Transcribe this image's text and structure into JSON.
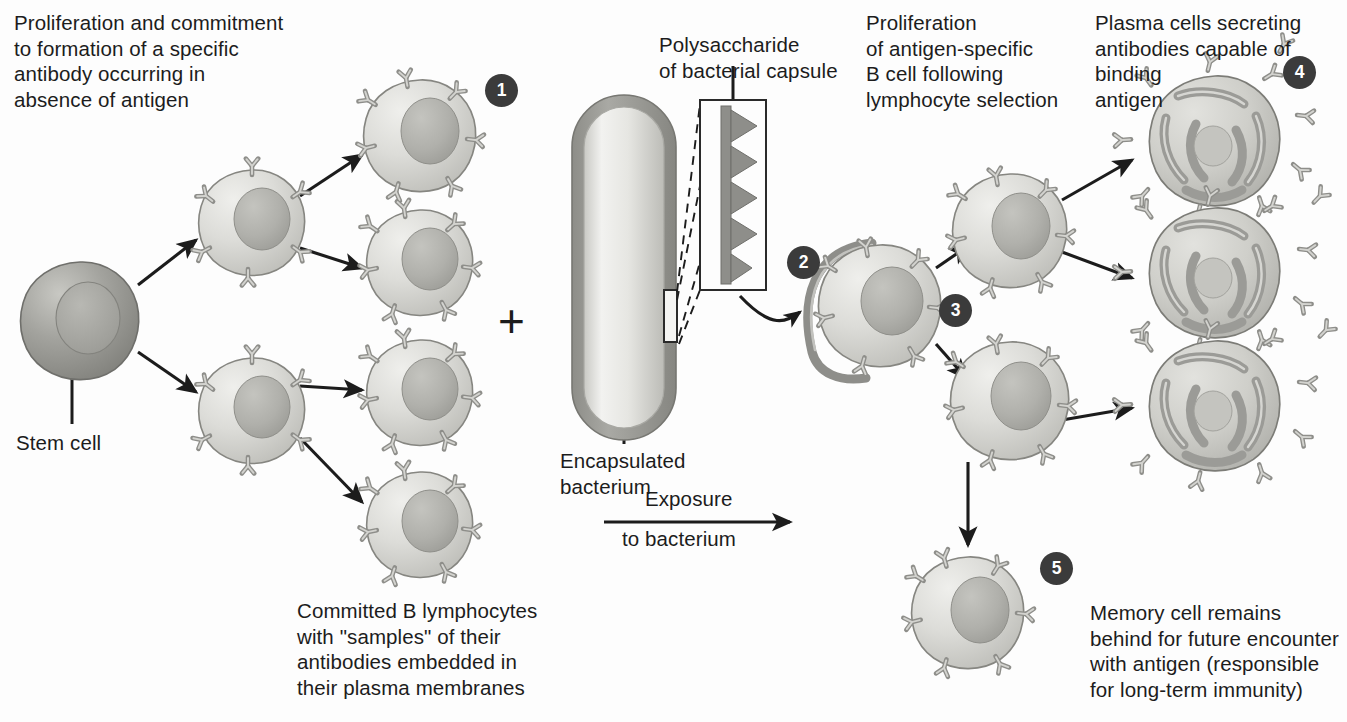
{
  "figure": {
    "background_color": "#fdfdfd",
    "ink_color": "#1c1c1c",
    "badge_color": "#3b3b3b",
    "badge_text_color": "#ffffff",
    "cell_fill": "#d9d9d6",
    "cell_outline": "#8b8b88",
    "nucleus_fill": "#b0b0ab",
    "stem_cell_fill": "#9a9a96",
    "plasma_cell_fill": "#c9c9c5",
    "er_fill": "#9b9b97",
    "antibody_fill": "#c6c6c2",
    "capsule_color": "#9a9a96",
    "antigen_color": "#8e8e8a"
  },
  "labels": {
    "intro": "Proliferation and commitment\nto formation of a specific\nantibody occurring in\nabsence of antigen",
    "stem_cell": "Stem cell",
    "committed_b": "Committed B lymphocytes\nwith \"samples\" of their\nantibodies embedded in\ntheir plasma membranes",
    "polysaccharide": "Polysaccharide\nof bacterial capsule",
    "encapsulated": "Encapsulated\nbacterium",
    "exposure_top": "Exposure",
    "exposure_bottom": "to bacterium",
    "proliferation": "Proliferation\nof antigen-specific\nB cell following\nlymphocyte selection",
    "plasma_cells": "Plasma cells secreting\nantibodies capable of\nbinding\nantigen",
    "memory_cell": "Memory cell remains\nbehind for future encounter\nwith antigen (responsible\nfor long-term immunity)",
    "plus_symbol": "+"
  },
  "badges": [
    {
      "id": "badge-1",
      "number": "1",
      "x": 485,
      "y": 74
    },
    {
      "id": "badge-2",
      "number": "2",
      "x": 787,
      "y": 246
    },
    {
      "id": "badge-3",
      "number": "3",
      "x": 939,
      "y": 294
    },
    {
      "id": "badge-4",
      "number": "4",
      "x": 1283,
      "y": 56
    },
    {
      "id": "badge-5",
      "number": "5",
      "x": 1040,
      "y": 552
    }
  ],
  "stages": [
    {
      "step": "1",
      "name": "committed-b-lymphocytes",
      "description": "Committed B lymphocytes with sample antibodies embedded in plasma membranes"
    },
    {
      "step": "2",
      "name": "antigen-binding",
      "description": "Antigen-specific B cell binds polysaccharide of bacterial capsule"
    },
    {
      "step": "3",
      "name": "proliferation",
      "description": "Proliferation of antigen-specific B cell following lymphocyte selection"
    },
    {
      "step": "4",
      "name": "plasma-cells",
      "description": "Plasma cells secreting antibodies capable of binding antigen"
    },
    {
      "step": "5",
      "name": "memory-cell",
      "description": "Memory cell remains behind for future encounter with antigen"
    }
  ],
  "cells": {
    "stem_cell": {
      "cx": 80,
      "cy": 320,
      "r": 58
    },
    "progenitors": [
      {
        "cx": 252,
        "cy": 222,
        "r": 52
      },
      {
        "cx": 252,
        "cy": 410,
        "r": 52
      }
    ],
    "committed_b_cells": [
      {
        "cx": 420,
        "cy": 135,
        "r": 55
      },
      {
        "cx": 420,
        "cy": 262,
        "r": 52
      },
      {
        "cx": 420,
        "cy": 392,
        "r": 52
      },
      {
        "cx": 420,
        "cy": 524,
        "r": 52
      }
    ],
    "selected_b_cell": {
      "cx": 880,
      "cy": 305,
      "r": 60
    },
    "daughter_cells": [
      {
        "cx": 1010,
        "cy": 230,
        "r": 56
      },
      {
        "cx": 1010,
        "cy": 400,
        "r": 58
      }
    ],
    "plasma_cells": [
      {
        "cx": 1215,
        "cy": 140,
        "r": 64
      },
      {
        "cx": 1215,
        "cy": 272,
        "r": 64
      },
      {
        "cx": 1215,
        "cy": 405,
        "r": 64
      }
    ],
    "memory_cell": {
      "cx": 968,
      "cy": 612,
      "r": 55
    }
  },
  "bacterium": {
    "x": 572,
    "y": 95,
    "width": 104,
    "height": 345,
    "capsule_thickness": 11,
    "inset_box": {
      "x": 700,
      "y": 100,
      "width": 66,
      "height": 190
    },
    "antigen_spike_count": 5
  }
}
